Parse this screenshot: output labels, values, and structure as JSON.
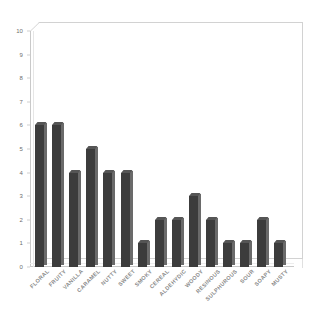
{
  "chart_data": {
    "type": "bar",
    "title": "",
    "subtitle": "",
    "xlabel": "",
    "ylabel": "",
    "ylim": [
      0,
      10
    ],
    "yticks": [
      0,
      1,
      2,
      3,
      4,
      5,
      6,
      7,
      8,
      9,
      10
    ],
    "ytick_labels": [
      "0",
      "1",
      "2",
      "3",
      "4",
      "5",
      "6",
      "7",
      "8",
      "9",
      "10"
    ],
    "grid": false,
    "legend": null,
    "legend_position": "none",
    "bar_color": "#3c3c3c",
    "frame_color": "#c9c9c9",
    "label_color": "#8a8a8a",
    "categories": [
      "FLORAL",
      "FRUITY",
      "VANILLA",
      "CARAMEL",
      "NUTTY",
      "SWEET",
      "SMOKY",
      "CEREAL",
      "ALDEHYDIC",
      "WOODY",
      "RESINOUS",
      "SULPHUROUS",
      "SOUR",
      "SOAPY",
      "MUSTY"
    ],
    "values": [
      6,
      6,
      4,
      5,
      4,
      4,
      1,
      2,
      2,
      3,
      2,
      1,
      1,
      2,
      1
    ]
  }
}
